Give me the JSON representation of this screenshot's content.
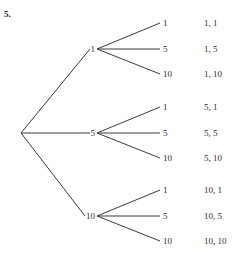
{
  "exercise": {
    "number": "5."
  },
  "colors": {
    "line": "#3a3a3a",
    "text": "#2b2b2b",
    "background": "#ffffff"
  },
  "chart_data": {
    "type": "diagram",
    "diagram_kind": "probability-tree",
    "title": "",
    "root": {
      "label": "",
      "x": 21,
      "y": 133
    },
    "level1": [
      {
        "label": "1",
        "x": 97,
        "y": 49
      },
      {
        "label": "5",
        "x": 97,
        "y": 133
      },
      {
        "label": "10",
        "x": 97,
        "y": 216
      }
    ],
    "level2": [
      {
        "parent": "1",
        "label": "1",
        "x": 163,
        "y": 23
      },
      {
        "parent": "1",
        "label": "5",
        "x": 163,
        "y": 49
      },
      {
        "parent": "1",
        "label": "10",
        "x": 163,
        "y": 74
      },
      {
        "parent": "5",
        "label": "1",
        "x": 163,
        "y": 107
      },
      {
        "parent": "5",
        "label": "5",
        "x": 163,
        "y": 133
      },
      {
        "parent": "5",
        "label": "10",
        "x": 163,
        "y": 158
      },
      {
        "parent": "10",
        "label": "1",
        "x": 163,
        "y": 190
      },
      {
        "parent": "10",
        "label": "5",
        "x": 163,
        "y": 216
      },
      {
        "parent": "10",
        "label": "10",
        "x": 163,
        "y": 241
      }
    ],
    "outcomes": [
      {
        "label": "1, 1",
        "x": 204,
        "y": 23
      },
      {
        "label": "1, 5",
        "x": 204,
        "y": 49
      },
      {
        "label": "1, 10",
        "x": 204,
        "y": 74
      },
      {
        "label": "5, 1",
        "x": 204,
        "y": 107
      },
      {
        "label": "5, 5",
        "x": 204,
        "y": 133
      },
      {
        "label": "5, 10",
        "x": 204,
        "y": 158
      },
      {
        "label": "10, 1",
        "x": 204,
        "y": 190
      },
      {
        "label": "10, 5",
        "x": 204,
        "y": 216
      },
      {
        "label": "10, 10",
        "x": 204,
        "y": 241
      }
    ]
  }
}
